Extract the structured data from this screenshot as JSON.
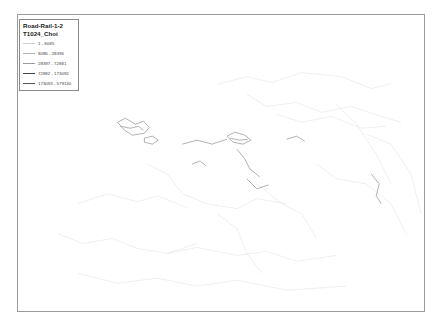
{
  "map": {
    "region": "Europe",
    "background_color": "#ffffff",
    "network_color": "#555555"
  },
  "legend": {
    "title": "Road-Rail-1-2",
    "subtitle": "T1024_Choi",
    "items": [
      {
        "label": "1 - 8085",
        "width": 0.3,
        "color": "#cfcfcf"
      },
      {
        "label": "8086 - 28396",
        "width": 0.5,
        "color": "#b5b5b5"
      },
      {
        "label": "28397 - 72881",
        "width": 0.7,
        "color": "#9a9a9a"
      },
      {
        "label": "72882 - 173092",
        "width": 1.2,
        "color": "#444444"
      },
      {
        "label": "173093 - 579130",
        "width": 0.9,
        "color": "#555555"
      }
    ]
  }
}
